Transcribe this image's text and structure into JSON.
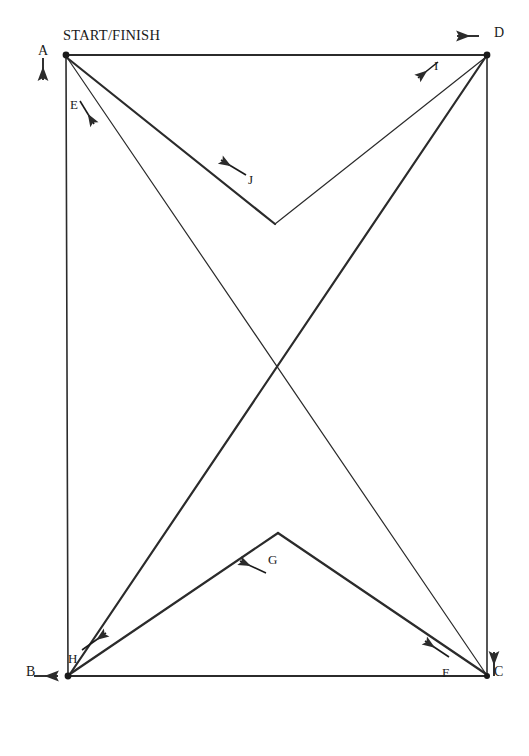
{
  "diagram": {
    "title": "START/FINISH",
    "stroke_color": "#2b2b2b",
    "background_color": "#ffffff",
    "type": "course-route-diagram",
    "corners": [
      {
        "id": "A",
        "label": "A",
        "x": 66,
        "y": 55,
        "label_x": 38,
        "label_y": 44
      },
      {
        "id": "B",
        "label": "B",
        "x": 68,
        "y": 676,
        "label_x": 26,
        "label_y": 665
      },
      {
        "id": "C",
        "label": "C",
        "x": 487,
        "y": 676,
        "label_x": 494,
        "label_y": 665
      },
      {
        "id": "D",
        "label": "D",
        "x": 487,
        "y": 55,
        "label_x": 494,
        "label_y": 26
      }
    ],
    "apexes": [
      {
        "id": "J-apex",
        "x": 275,
        "y": 224
      },
      {
        "id": "G-apex",
        "x": 278,
        "y": 533
      }
    ],
    "segments": [
      {
        "id": "E",
        "label": "E",
        "from": "A",
        "to": "B",
        "label_x": 70,
        "label_y": 98,
        "weight": "thin"
      },
      {
        "id": "H",
        "label": "H",
        "from": "B",
        "to": "J-apex",
        "label_x": 68,
        "label_y": 652,
        "weight": "thin"
      },
      {
        "id": "G",
        "label": "G",
        "from": "C",
        "to": "G-apex",
        "label_x": 268,
        "label_y": 553,
        "weight": "thick"
      },
      {
        "id": "F",
        "label": "F",
        "from": "C",
        "to": "A",
        "label_x": 442,
        "label_y": 666,
        "weight": "thin"
      },
      {
        "id": "I",
        "label": "I",
        "from": "D",
        "to": "J-apex",
        "label_x": 434,
        "label_y": 59,
        "weight": "thin"
      },
      {
        "id": "J",
        "label": "J",
        "from": "A",
        "to": "J-apex",
        "label_x": 248,
        "label_y": 173,
        "weight": "thick"
      }
    ],
    "direction_arrows": [
      {
        "id": "arrow-A",
        "at": "A",
        "direction": "down",
        "glyph": "down-arrow-icon"
      },
      {
        "id": "arrow-B",
        "at": "B",
        "direction": "right",
        "glyph": "right-arrow-icon"
      },
      {
        "id": "arrow-C",
        "at": "C",
        "direction": "up",
        "glyph": "up-arrow-icon"
      },
      {
        "id": "arrow-D",
        "at": "D",
        "direction": "left",
        "glyph": "left-arrow-icon"
      },
      {
        "id": "arrow-E",
        "at": "E",
        "direction": "down-right",
        "glyph": "diagonal-arrow-icon"
      },
      {
        "id": "arrow-F",
        "at": "F",
        "direction": "up-left",
        "glyph": "diagonal-arrow-icon"
      },
      {
        "id": "arrow-G",
        "at": "G",
        "direction": "down-left",
        "glyph": "diagonal-arrow-icon"
      },
      {
        "id": "arrow-H",
        "at": "H",
        "direction": "up-right",
        "glyph": "diagonal-arrow-icon"
      },
      {
        "id": "arrow-I",
        "at": "I",
        "direction": "down-left",
        "glyph": "diagonal-arrow-icon"
      },
      {
        "id": "arrow-J",
        "at": "J",
        "direction": "left",
        "glyph": "left-arrow-icon"
      }
    ]
  }
}
